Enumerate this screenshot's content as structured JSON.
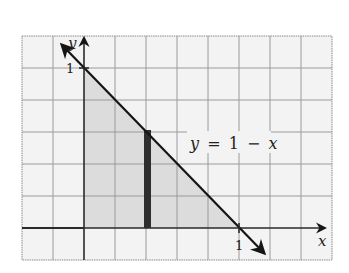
{
  "diagram": {
    "type": "coordinate-plane",
    "axes": {
      "x_label": "x",
      "y_label": "y",
      "x_tick_label": "1",
      "y_tick_label": "1"
    },
    "line": {
      "equation_label": "y = 1 − x",
      "equation_parts": [
        "y",
        "=",
        "1",
        "−",
        "x"
      ]
    },
    "region": {
      "vertices": [
        [
          0,
          0
        ],
        [
          0,
          1
        ],
        [
          1,
          0
        ]
      ],
      "fill_color": "#dcdcdc"
    },
    "strip": {
      "x": 0.4,
      "y_from": 0,
      "y_to": 0.6,
      "color": "#2e2e2e"
    },
    "colors": {
      "grid": "#9a9a9a",
      "axis": "#2a2a2a",
      "line": "#151515",
      "background": "#f3f3f3"
    }
  }
}
